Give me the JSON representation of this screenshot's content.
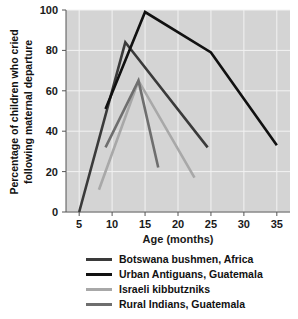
{
  "chart_data": {
    "type": "line",
    "title": "",
    "xlabel": "Age (months)",
    "ylabel": "Percentage of children who cried following maternal departure",
    "ylabel_line1": "Percentage of children who cried",
    "ylabel_line2": "following maternal departure",
    "xlim": [
      3,
      37
    ],
    "ylim": [
      0,
      100
    ],
    "xticks": [
      5,
      10,
      15,
      20,
      25,
      30,
      35
    ],
    "xtick_labels": [
      "5",
      "10",
      "15",
      "20",
      "25",
      "30",
      "35"
    ],
    "yticks": [
      0,
      20,
      40,
      60,
      80,
      100
    ],
    "ytick_labels": [
      "0",
      "20",
      "40",
      "60",
      "80",
      "100"
    ],
    "grid": true,
    "legend_position": "below",
    "plot_background": "#d4d4d4",
    "grid_color": "#f2f2f2",
    "series": [
      {
        "name": "Botswana bushmen, Africa",
        "color": "#3a3a3a",
        "x": [
          5,
          12,
          24.5
        ],
        "values": [
          0,
          84,
          32
        ]
      },
      {
        "name": "Urban Antiguans, Guatemala",
        "color": "#111111",
        "x": [
          9,
          15,
          25,
          35
        ],
        "values": [
          51,
          99,
          79,
          33
        ]
      },
      {
        "name": "Israeli kibbutzniks",
        "color": "#a8a8a8",
        "x": [
          8,
          14,
          22.5
        ],
        "values": [
          11,
          65,
          17
        ]
      },
      {
        "name": "Rural Indians, Guatemala",
        "color": "#6e6e6e",
        "x": [
          9,
          14,
          17
        ],
        "values": [
          32,
          65,
          22
        ]
      }
    ]
  },
  "legend": {
    "items": [
      {
        "label": "Botswana bushmen, Africa",
        "color": "#3a3a3a"
      },
      {
        "label": "Urban Antiguans, Guatemala",
        "color": "#111111"
      },
      {
        "label": "Israeli kibbutzniks",
        "color": "#a8a8a8"
      },
      {
        "label": "Rural Indians, Guatemala",
        "color": "#6e6e6e"
      }
    ]
  }
}
